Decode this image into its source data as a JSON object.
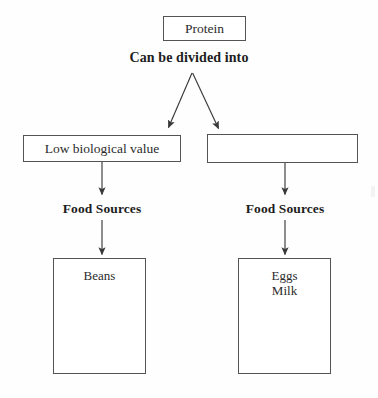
{
  "diagram": {
    "title": "Protein",
    "type": "flowchart",
    "background_color": "#fefefe",
    "line_color": "#545454",
    "text_color": "#2b2b2b",
    "root": {
      "label": "Protein"
    },
    "connector_labels": {
      "root_split": "Can be divided into",
      "left_sources": "Food Sources",
      "right_sources": "Food Sources"
    },
    "branches": [
      {
        "type_label": "Low biological value",
        "type_label_filled": true,
        "sources_label": "Food Sources",
        "sources": "Beans"
      },
      {
        "type_label": "",
        "type_label_filled": false,
        "sources_label": "Food Sources",
        "sources": "Eggs\nMilk"
      }
    ]
  },
  "edges": {
    "split_left": "arrow-protein-to-low-biological-value",
    "split_right": "arrow-protein-to-blank-type",
    "left_type_to_label": "arrow-low-biological-value-to-food-sources",
    "left_label_to_box": "arrow-food-sources-to-beans",
    "right_type_to_label": "arrow-blank-type-to-food-sources",
    "right_label_to_box": "arrow-food-sources-to-eggs-milk"
  }
}
